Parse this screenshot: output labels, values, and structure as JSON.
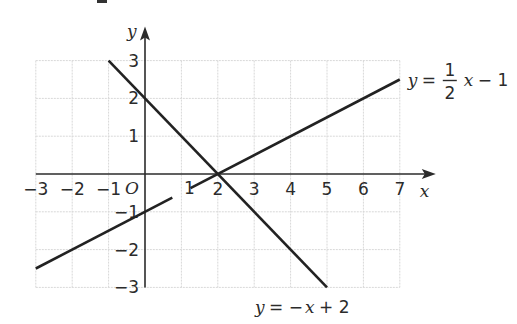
{
  "chart_data": {
    "type": "line",
    "title": "",
    "xlabel": "x",
    "ylabel": "y",
    "origin_label": "O",
    "xlim": [
      -3,
      7
    ],
    "ylim": [
      -3,
      3
    ],
    "grid": true,
    "x_ticks": [
      "-3",
      "-2",
      "-1",
      "1",
      "2",
      "3",
      "4",
      "5",
      "6",
      "7"
    ],
    "y_ticks": [
      "3",
      "2",
      "1",
      "-1",
      "-2",
      "-3"
    ],
    "series": [
      {
        "name": "y = 1/2 x - 1",
        "equation": "y = (1/2)x - 1",
        "label_parts": {
          "lhs": "y",
          "eq": "=",
          "num": "1",
          "den": "2",
          "var": "x",
          "rest": "− 1"
        },
        "points": [
          {
            "x": -3,
            "y": -2.5
          },
          {
            "x": 7,
            "y": 2.5
          }
        ],
        "gap": {
          "from_x": 1,
          "to_x": 1.3
        }
      },
      {
        "name": "y = -x + 2",
        "equation": "y = -x + 2",
        "label_parts": {
          "lhs": "y",
          "eq": "= −",
          "var": "x",
          "rest": "+ 2"
        },
        "points": [
          {
            "x": -1,
            "y": 3
          },
          {
            "x": 5,
            "y": -3
          }
        ]
      }
    ],
    "intersection": {
      "x": 2,
      "y": 0
    }
  }
}
